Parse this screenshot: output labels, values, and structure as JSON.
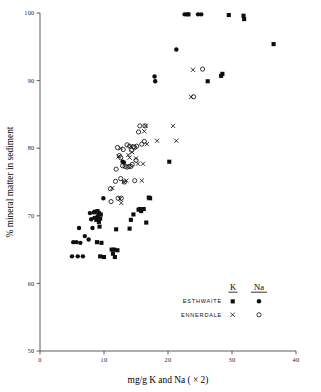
{
  "figure": {
    "background": "#ffffff",
    "ink": "#111111"
  },
  "axes": {
    "x": {
      "label": "mg/g K and Na ( × 2)",
      "ticks": [
        0,
        10,
        20,
        30,
        40
      ],
      "tick_labels": [
        "0",
        "10",
        "20",
        "30",
        "40"
      ],
      "range": [
        0,
        40
      ]
    },
    "y": {
      "label": "% mineral matter in sediment",
      "ticks": [
        50,
        60,
        70,
        80,
        90,
        100
      ],
      "tick_labels": [
        "50",
        "60",
        "70",
        "80",
        "90",
        "100"
      ],
      "range": [
        50,
        100
      ]
    }
  },
  "legend": {
    "columns": [
      "K",
      "Na"
    ],
    "rows": [
      {
        "name": "ESTHWAITE",
        "k_marker": "filled-square",
        "na_marker": "filled-circle"
      },
      {
        "name": "ENNERDALE",
        "k_marker": "cross",
        "na_marker": "open-circle"
      }
    ]
  },
  "chart_data": {
    "type": "scatter",
    "title": "",
    "xlabel": "mg/g K and Na ( × 2)",
    "ylabel": "% mineral matter in sediment",
    "xlim": [
      0,
      40
    ],
    "ylim": [
      50,
      100
    ],
    "grid": false,
    "legend_position": "bottom-right",
    "series": [
      {
        "name": "ESTHWAITE K",
        "marker": "filled-square",
        "points": [
          [
            8.6,
            70.6
          ],
          [
            9.0,
            70.7
          ],
          [
            9.2,
            70.4
          ],
          [
            9.0,
            69.9
          ],
          [
            8.8,
            69.4
          ],
          [
            9.2,
            69.1
          ],
          [
            9.4,
            69.6
          ],
          [
            9.5,
            70.2
          ],
          [
            9.3,
            68.4
          ],
          [
            9.6,
            66.0
          ],
          [
            8.9,
            66.1
          ],
          [
            9.4,
            64.0
          ],
          [
            11.2,
            65.0
          ],
          [
            11.6,
            65.0
          ],
          [
            11.4,
            64.4
          ],
          [
            11.7,
            63.9
          ],
          [
            11.9,
            68.0
          ],
          [
            14.2,
            69.4
          ],
          [
            14.0,
            68.1
          ],
          [
            14.6,
            70.2
          ],
          [
            15.4,
            70.9
          ],
          [
            15.6,
            71.0
          ],
          [
            15.8,
            70.7
          ],
          [
            16.2,
            71.0
          ],
          [
            16.6,
            69.0
          ],
          [
            17.0,
            72.7
          ],
          [
            17.2,
            72.6
          ],
          [
            20.2,
            78.0
          ],
          [
            26.2,
            89.9
          ],
          [
            28.3,
            90.7
          ],
          [
            28.5,
            91.0
          ],
          [
            29.5,
            99.7
          ],
          [
            31.8,
            99.6
          ],
          [
            31.9,
            99.1
          ],
          [
            36.5,
            95.4
          ],
          [
            23.2,
            99.8
          ],
          [
            12.1,
            64.9
          ],
          [
            10.0,
            63.9
          ]
        ]
      },
      {
        "name": "ESTHWAITE Na",
        "marker": "filled-circle",
        "points": [
          [
            5.0,
            64.0
          ],
          [
            5.9,
            64.0
          ],
          [
            6.7,
            64.0
          ],
          [
            5.2,
            66.1
          ],
          [
            5.7,
            66.1
          ],
          [
            6.3,
            66.0
          ],
          [
            6.1,
            68.2
          ],
          [
            7.0,
            67.0
          ],
          [
            7.8,
            70.4
          ],
          [
            8.0,
            69.5
          ],
          [
            8.2,
            68.2
          ],
          [
            8.4,
            70.5
          ],
          [
            8.5,
            69.7
          ],
          [
            7.6,
            66.5
          ],
          [
            9.9,
            72.6
          ],
          [
            12.9,
            78.0
          ],
          [
            13.1,
            77.9
          ],
          [
            17.9,
            90.6
          ],
          [
            18.0,
            89.9
          ],
          [
            21.3,
            94.6
          ],
          [
            22.6,
            99.8
          ],
          [
            23.0,
            99.8
          ],
          [
            24.7,
            99.8
          ],
          [
            25.2,
            99.8
          ]
        ]
      },
      {
        "name": "ENNERDALE K",
        "marker": "cross",
        "points": [
          [
            11.3,
            74.1
          ],
          [
            12.5,
            72.5
          ],
          [
            12.7,
            71.9
          ],
          [
            13.1,
            75.0
          ],
          [
            13.5,
            75.2
          ],
          [
            12.6,
            80.0
          ],
          [
            13.8,
            79.0
          ],
          [
            14.0,
            78.6
          ],
          [
            14.2,
            80.3
          ],
          [
            14.4,
            79.4
          ],
          [
            15.0,
            78.5
          ],
          [
            15.3,
            77.7
          ],
          [
            16.1,
            77.7
          ],
          [
            16.3,
            82.5
          ],
          [
            16.5,
            83.3
          ],
          [
            16.7,
            80.6
          ],
          [
            17.1,
            72.6
          ],
          [
            18.3,
            81.1
          ],
          [
            20.8,
            83.3
          ],
          [
            21.3,
            81.1
          ],
          [
            23.9,
            91.6
          ],
          [
            23.6,
            87.6
          ],
          [
            15.9,
            75.2
          ],
          [
            12.3,
            78.8
          ]
        ]
      },
      {
        "name": "ENNERDALE Na",
        "marker": "open-circle",
        "points": [
          [
            11.0,
            74.0
          ],
          [
            11.1,
            72.1
          ],
          [
            12.2,
            72.6
          ],
          [
            12.7,
            72.6
          ],
          [
            11.8,
            75.1
          ],
          [
            12.6,
            75.5
          ],
          [
            13.2,
            75.0
          ],
          [
            12.1,
            80.1
          ],
          [
            12.4,
            78.9
          ],
          [
            12.6,
            78.6
          ],
          [
            12.9,
            77.4
          ],
          [
            13.3,
            77.3
          ],
          [
            13.6,
            77.2
          ],
          [
            13.9,
            77.3
          ],
          [
            14.2,
            77.3
          ],
          [
            14.4,
            77.6
          ],
          [
            13.6,
            80.5
          ],
          [
            14.0,
            80.3
          ],
          [
            14.3,
            79.7
          ],
          [
            14.6,
            80.2
          ],
          [
            14.8,
            80.1
          ],
          [
            15.1,
            80.3
          ],
          [
            15.9,
            80.6
          ],
          [
            16.3,
            81.0
          ],
          [
            15.4,
            82.4
          ],
          [
            15.6,
            83.3
          ],
          [
            16.4,
            83.3
          ],
          [
            15.0,
            78.2
          ],
          [
            13.0,
            79.8
          ],
          [
            11.9,
            76.9
          ],
          [
            24.0,
            87.6
          ],
          [
            25.4,
            91.7
          ],
          [
            14.8,
            75.2
          ]
        ]
      }
    ]
  }
}
